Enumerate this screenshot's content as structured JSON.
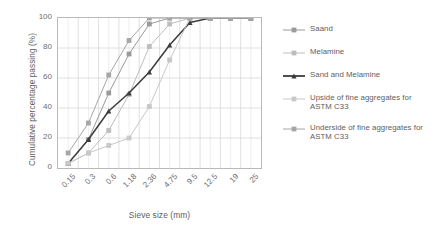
{
  "chart_data": {
    "type": "line",
    "title": "",
    "xlabel": "Sieve size (mm)",
    "ylabel": "Cumulative percentage passing (%)",
    "categories": [
      "0.15",
      "0.3",
      "0.6",
      "1.18",
      "2.36",
      "4.75",
      "9.5",
      "12.5",
      "19",
      "25"
    ],
    "ylim": [
      0,
      100
    ],
    "yticks": [
      "0",
      "20",
      "40",
      "60",
      "80",
      "100"
    ],
    "grid": true,
    "legend_position": "right",
    "series": [
      {
        "name": "Saand",
        "color": "#9a9a9a",
        "marker": "square",
        "values": [
          3,
          19,
          50,
          76,
          96,
          100,
          100,
          100,
          100,
          100
        ]
      },
      {
        "name": "Melamine",
        "color": "#bdbdbd",
        "marker": "square",
        "values": [
          3,
          10,
          25,
          49,
          81,
          96,
          100,
          100,
          100,
          100
        ]
      },
      {
        "name": "Sand and Melamine",
        "color": "#3c3c3c",
        "marker": "triangle",
        "values": [
          3,
          19,
          38,
          50,
          64,
          82,
          97,
          100,
          100,
          100
        ]
      },
      {
        "name": "Upside of fine aggregates for ASTM C33",
        "color": "#c8c8c8",
        "marker": "square",
        "values": [
          3,
          10,
          15,
          20,
          41,
          72,
          100,
          100,
          100,
          100
        ]
      },
      {
        "name": "Underside of fine aggregates for ASTM C33",
        "color": "#a6a6a6",
        "marker": "square",
        "values": [
          10,
          30,
          62,
          85,
          100,
          100,
          100,
          100,
          100,
          100
        ]
      }
    ]
  },
  "axis": {
    "ylabel": "Cumulative percentage passing (%)",
    "xlabel": "Sieve size (mm)",
    "yticks": [
      "100",
      "80",
      "60",
      "40",
      "20",
      "0"
    ],
    "xticks": [
      "0.15",
      "0.3",
      "0.6",
      "1.18",
      "2.36",
      "4.75",
      "9.5",
      "12.5",
      "19",
      "25"
    ]
  },
  "legend": {
    "items": [
      {
        "label": "Saand"
      },
      {
        "label": "Melamine"
      },
      {
        "label": "Sand and Melamine"
      },
      {
        "label": "Upside of fine aggregates for ASTM C33"
      },
      {
        "label": "Underside of fine aggregates for ASTM C33"
      }
    ]
  },
  "colors": {
    "grid": "#d8d8d8",
    "minor_grid": "#e6e6e6",
    "axis": "#b9b9b9",
    "text": "#6e6e6e"
  }
}
